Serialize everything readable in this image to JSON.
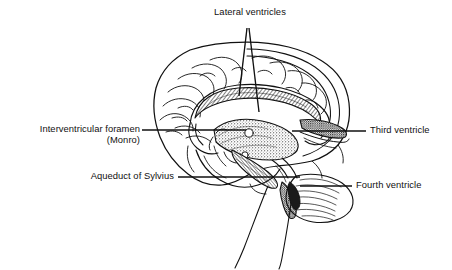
{
  "figure": {
    "style": "black-and-white line drawing with stipple shading",
    "ink_color": "#111111",
    "background_color": "#ffffff"
  },
  "labels": {
    "lateral_ventricles": "Lateral ventricles",
    "interventricular_foramen_line1": "Interventricular foramen",
    "interventricular_foramen_line2": "(Monro)",
    "aqueduct_of_sylvius": "Aqueduct of Sylvius",
    "third_ventricle": "Third ventricle",
    "fourth_ventricle": "Fourth ventricle"
  },
  "leaders": [
    {
      "name": "lateral-ventricles-left-pointer",
      "from_x": 247,
      "from_y": 28,
      "to_x": 239,
      "to_y": 96
    },
    {
      "name": "lateral-ventricles-right-pointer",
      "from_x": 249,
      "from_y": 28,
      "to_x": 259,
      "to_y": 112
    },
    {
      "name": "interventricular-foramen-leader",
      "from_x": 142,
      "from_y": 130,
      "to_x": 246,
      "to_y": 130
    },
    {
      "name": "third-ventricle-leader",
      "from_x": 292,
      "from_y": 131,
      "to_x": 366,
      "to_y": 131
    },
    {
      "name": "aqueduct-of-sylvius-leader",
      "from_x": 178,
      "from_y": 177,
      "to_x": 300,
      "to_y": 177
    },
    {
      "name": "fourth-ventricle-leader",
      "from_x": 300,
      "from_y": 186,
      "to_x": 352,
      "to_y": 186
    }
  ],
  "anatomy_parts": [
    "cerebral-cortex",
    "corpus-callosum",
    "lateral-ventricle",
    "third-ventricle",
    "cerebral-aqueduct",
    "fourth-ventricle",
    "cerebellum",
    "brainstem",
    "spinal-cord"
  ]
}
